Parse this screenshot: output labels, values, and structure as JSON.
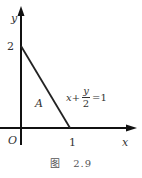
{
  "figure": {
    "caption_prefix": "图",
    "caption_number": "2.9",
    "axes": {
      "x_label": "x",
      "y_label": "y",
      "origin_label": "O"
    },
    "ticks": {
      "x_tick": "1",
      "y_tick": "2"
    },
    "region_label": "A",
    "equation": {
      "lhs_var": "x",
      "plus": "+",
      "numerator": "y",
      "denominator": "2",
      "equals": "=",
      "rhs": "1"
    },
    "line": {
      "x_intercept": 1,
      "y_intercept": 2,
      "equation_text": "x + y/2 = 1"
    },
    "colors": {
      "axis": "#111111",
      "line": "#222222",
      "text": "#333333"
    }
  }
}
